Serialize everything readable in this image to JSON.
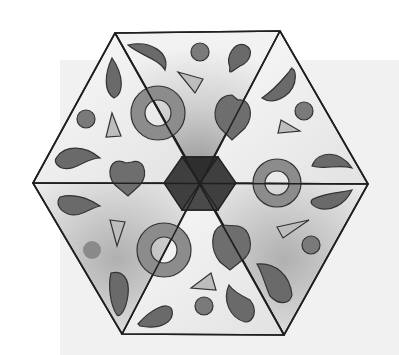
{
  "image": {
    "description": "Grayscale illustration of a hexagon divided into six triangular sectors, each decorated with paisley/teardrop shapes, circles, rings and small triangles; dark hexagon at the center.",
    "colors": {
      "background": "#ffffff",
      "panel": "#f1f1f1",
      "outline": "#222222",
      "dark_fill": "#6a6a6a",
      "medium_fill": "#8c8c8c",
      "light_fill": "#bdbdbd",
      "center_hex": "#3a3a3a",
      "sector_light": "#f4f4f4",
      "sector_shaded": "#c8c8c8"
    },
    "hexagon": {
      "vertices": [
        [
          115,
          33
        ],
        [
          280,
          31
        ],
        [
          368,
          184
        ],
        [
          284,
          335
        ],
        [
          122,
          334
        ],
        [
          33,
          183
        ]
      ],
      "center": [
        200,
        183
      ]
    },
    "shapes": {
      "rings": 3,
      "paisleys": 12,
      "circles": 6,
      "triangles": 6,
      "hearts": 3
    }
  }
}
